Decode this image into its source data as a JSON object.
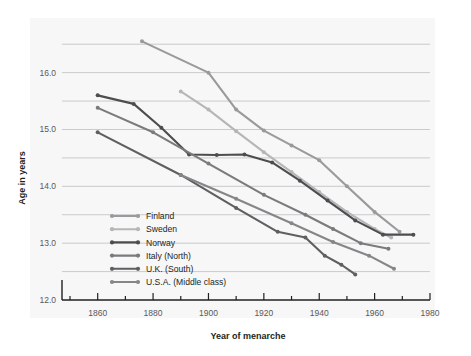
{
  "chart_data": {
    "type": "line",
    "title": "",
    "xlabel": "Year of menarche",
    "ylabel": "Age in years",
    "xlim": [
      1850,
      1980
    ],
    "ylim": [
      12.0,
      16.75
    ],
    "xticks": [
      1860,
      1880,
      1900,
      1920,
      1940,
      1960,
      1980
    ],
    "xticklabels": [
      "1860",
      "1880",
      "1900",
      "1920",
      "1940",
      "1960",
      "1980"
    ],
    "xminorticks": [
      1850,
      1870,
      1890,
      1910,
      1930,
      1950,
      1970
    ],
    "yticks": [
      12.0,
      13.0,
      14.0,
      15.0,
      16.0
    ],
    "yticklabels": [
      "12.0",
      "13.0",
      "14.0",
      "15.0",
      "16.0"
    ],
    "ygridlines": [
      12.5,
      13.0,
      13.5,
      14.0,
      14.5,
      15.0,
      15.5,
      16.0,
      16.5
    ],
    "grid": "horizontal",
    "legend_position": "inside-lower-left",
    "series": [
      {
        "name": "Finland",
        "color": "#9a9a9c",
        "x": [
          1876,
          1900,
          1910,
          1920,
          1930,
          1940,
          1950,
          1960,
          1969
        ],
        "y": [
          16.55,
          16.0,
          15.35,
          14.98,
          14.72,
          14.46,
          14.0,
          13.55,
          13.2
        ]
      },
      {
        "name": "Sweden",
        "color": "#b6b6b8",
        "x": [
          1890,
          1900,
          1910,
          1920,
          1930,
          1940,
          1950,
          1960,
          1966
        ],
        "y": [
          15.67,
          15.35,
          14.97,
          14.6,
          14.25,
          13.9,
          13.55,
          13.25,
          13.1
        ]
      },
      {
        "name": "Norway",
        "color": "#4d4d4f",
        "x": [
          1860,
          1873,
          1883,
          1893,
          1903,
          1913,
          1923,
          1933,
          1943,
          1953,
          1963,
          1974
        ],
        "y": [
          15.6,
          15.45,
          15.03,
          14.56,
          14.55,
          14.56,
          14.42,
          14.1,
          13.75,
          13.4,
          13.15,
          13.15
        ]
      },
      {
        "name": "Italy (North)",
        "color": "#7b7b7d",
        "x": [
          1860,
          1880,
          1900,
          1920,
          1935,
          1945,
          1955,
          1965
        ],
        "y": [
          15.38,
          14.95,
          14.4,
          13.85,
          13.5,
          13.25,
          13.0,
          12.9
        ]
      },
      {
        "name": "U.K. (South)",
        "color": "#5f5f61",
        "x": [
          1860,
          1890,
          1910,
          1925,
          1935,
          1942,
          1948,
          1953
        ],
        "y": [
          14.95,
          14.2,
          13.62,
          13.2,
          13.1,
          12.78,
          12.62,
          12.45
        ]
      },
      {
        "name": "U.S.A. (Middle class)",
        "color": "#868688",
        "x": [
          1890,
          1910,
          1930,
          1945,
          1958,
          1967
        ],
        "y": [
          14.2,
          13.78,
          13.35,
          13.02,
          12.78,
          12.55
        ]
      }
    ]
  },
  "legend": {
    "items": [
      {
        "label": "Finland"
      },
      {
        "label": "Sweden"
      },
      {
        "label": "Norway"
      },
      {
        "label": "Italy (North)"
      },
      {
        "label": "U.K. (South)"
      },
      {
        "label": "U.S.A. (Middle class)"
      }
    ]
  }
}
